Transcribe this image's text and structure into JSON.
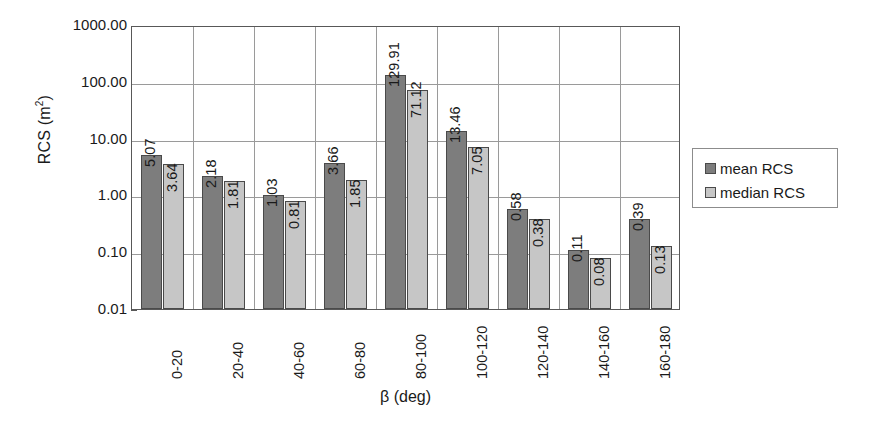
{
  "chart_data": {
    "type": "bar",
    "title": "",
    "xlabel": "β (deg)",
    "ylabel": "RCS (m²)",
    "yscale": "log",
    "ylim": [
      0.01,
      1000.0
    ],
    "ytick_labels": [
      "1000.00",
      "100.00",
      "10.00",
      "1.00",
      "0.10",
      "0.01"
    ],
    "ytick_values": [
      1000,
      100,
      10,
      1,
      0.1,
      0.01
    ],
    "grid": "both",
    "legend_position": "right",
    "categories": [
      "0-20",
      "20-40",
      "40-60",
      "60-80",
      "80-100",
      "100-120",
      "120-140",
      "140-160",
      "160-180"
    ],
    "series": [
      {
        "name": "mean RCS",
        "color": "#7d7d7d",
        "values": [
          5.07,
          2.18,
          1.03,
          3.66,
          129.91,
          13.46,
          0.58,
          0.11,
          0.39
        ],
        "labels": [
          "5.07",
          "2.18",
          "1.03",
          "3.66",
          "129.91",
          "13.46",
          "0.58",
          "0.11",
          "0.39"
        ]
      },
      {
        "name": "median RCS",
        "color": "#c6c6c6",
        "values": [
          3.64,
          1.81,
          0.81,
          1.85,
          71.12,
          7.05,
          0.38,
          0.08,
          0.13
        ],
        "labels": [
          "3.64",
          "1.81",
          "0.81",
          "1.85",
          "71.12",
          "7.05",
          "0.38",
          "0.08",
          "0.13"
        ]
      }
    ]
  },
  "legend": {
    "items": [
      {
        "label": "mean RCS",
        "color": "#7d7d7d"
      },
      {
        "label": "median RCS",
        "color": "#c6c6c6"
      }
    ]
  },
  "axes": {
    "y_title_text": "RCS (m",
    "y_title_sup": "2",
    "y_title_tail": ")",
    "x_title": "β (deg)"
  }
}
